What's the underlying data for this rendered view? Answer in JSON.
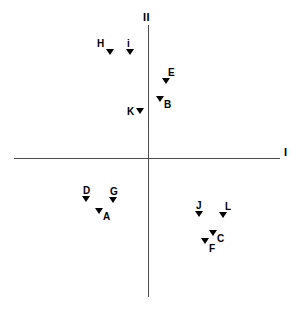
{
  "chart_data": {
    "type": "scatter",
    "title": "",
    "subtitle": "",
    "xlabel": "I",
    "ylabel": "II",
    "grid": false,
    "legend": "none",
    "axis_style": "crossed-at-origin",
    "xlim": [
      -1,
      1
    ],
    "ylim": [
      -1,
      1
    ],
    "origin_px": {
      "x": 148,
      "y": 158
    },
    "axis_extent_px": {
      "x_start": 14,
      "x_end": 280,
      "y_start": 25,
      "y_end": 297
    },
    "marker_shape": "down-triangle",
    "marker_color": "#000000",
    "points": [
      {
        "label": "H",
        "px": 110,
        "py": 52,
        "label_pos": "above-left",
        "quadrant": "upper-left"
      },
      {
        "label": "i",
        "px": 130,
        "py": 52,
        "label_pos": "above",
        "quadrant": "upper-left"
      },
      {
        "label": "E",
        "px": 166,
        "py": 81,
        "label_pos": "above-right",
        "quadrant": "upper-right"
      },
      {
        "label": "B",
        "px": 160,
        "py": 99,
        "label_pos": "right-below",
        "quadrant": "upper-right"
      },
      {
        "label": "K",
        "px": 140,
        "py": 111,
        "label_pos": "left",
        "quadrant": "upper-left"
      },
      {
        "label": "D",
        "px": 86,
        "py": 199,
        "label_pos": "above",
        "quadrant": "lower-left"
      },
      {
        "label": "G",
        "px": 113,
        "py": 200,
        "label_pos": "above",
        "quadrant": "lower-left"
      },
      {
        "label": "A",
        "px": 99,
        "py": 211,
        "label_pos": "right-below",
        "quadrant": "lower-left"
      },
      {
        "label": "J",
        "px": 199,
        "py": 214,
        "label_pos": "above",
        "quadrant": "lower-right"
      },
      {
        "label": "L",
        "px": 223,
        "py": 215,
        "label_pos": "above-right",
        "quadrant": "lower-right"
      },
      {
        "label": "C",
        "px": 213,
        "py": 233,
        "label_pos": "right-below",
        "quadrant": "lower-right"
      },
      {
        "label": "F",
        "px": 205,
        "py": 241,
        "label_pos": "below-right",
        "quadrant": "lower-right"
      }
    ]
  },
  "axes": {
    "x_label": "I",
    "y_label": "II"
  }
}
